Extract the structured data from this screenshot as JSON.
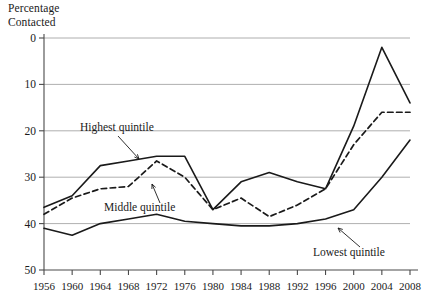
{
  "chart_data": {
    "type": "line",
    "title": "",
    "ylabel": "Percentage Contacted",
    "xlabel": "",
    "ylim": [
      0,
      50
    ],
    "yticks": [
      0,
      10,
      20,
      30,
      40,
      50
    ],
    "grid": "horizontal",
    "legend_position": "inline-annotations",
    "categories": [
      1956,
      1960,
      1964,
      1968,
      1972,
      1976,
      1980,
      1984,
      1988,
      1992,
      1996,
      2000,
      2004,
      2008
    ],
    "series": [
      {
        "name": "Highest quintile",
        "style": "solid",
        "values": [
          13.5,
          16,
          22.5,
          23.5,
          24.5,
          24.5,
          13,
          19,
          21,
          19,
          17.5,
          31,
          48,
          36
        ]
      },
      {
        "name": "Middle quintile",
        "style": "dashed",
        "values": [
          12,
          15.5,
          17.5,
          18,
          23.5,
          20,
          13,
          15.5,
          11.5,
          14,
          17.5,
          27,
          34,
          34
        ]
      },
      {
        "name": "Lowest quintile",
        "style": "solid",
        "values": [
          9,
          7.5,
          10,
          11,
          12,
          10.5,
          10,
          9.5,
          9.5,
          10,
          11,
          13,
          20,
          28
        ]
      }
    ],
    "annotations": [
      {
        "text": "Highest quintile",
        "series": "Highest quintile"
      },
      {
        "text": "Middle quintile",
        "series": "Middle quintile"
      },
      {
        "text": "Lowest quintile",
        "series": "Lowest quintile"
      }
    ]
  },
  "axis": {
    "y_title_line1": "Percentage",
    "y_title_line2": "Contacted",
    "ytick_labels": [
      "50",
      "40",
      "30",
      "20",
      "10",
      "0"
    ],
    "xtick_labels": [
      "1956",
      "1960",
      "1964",
      "1968",
      "1972",
      "1976",
      "1980",
      "1984",
      "1988",
      "1992",
      "1996",
      "2000",
      "2004",
      "2008"
    ]
  },
  "annotations": {
    "highest": "Highest quintile",
    "middle": "Middle quintile",
    "lowest": "Lowest quintile"
  },
  "colors": {
    "line": "#1a1a1a",
    "grid": "#9a9a9a",
    "axis": "#4a4a4a",
    "background": "#ffffff"
  }
}
